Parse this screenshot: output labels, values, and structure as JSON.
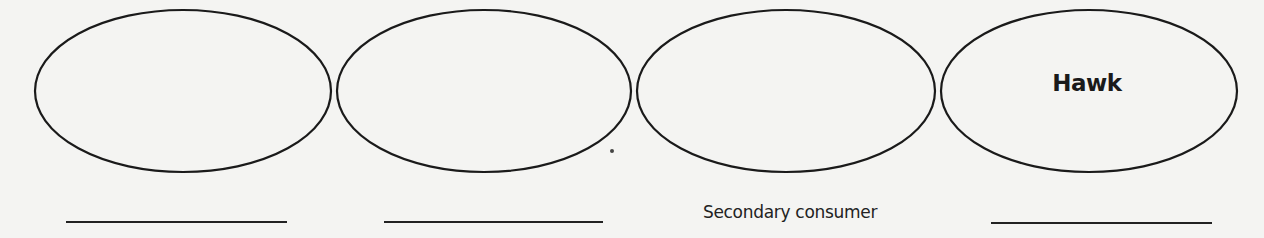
{
  "diagram": {
    "type": "food-chain-worksheet",
    "stroke_color": "#1a1a1a",
    "background_color": "#f4f4f2",
    "nodes": [
      {
        "id": 1,
        "label": "",
        "caption": ""
      },
      {
        "id": 2,
        "label": "",
        "caption": ""
      },
      {
        "id": 3,
        "label": "",
        "caption": "Secondary consumer"
      },
      {
        "id": 4,
        "label": "Hawk",
        "caption": ""
      }
    ]
  }
}
